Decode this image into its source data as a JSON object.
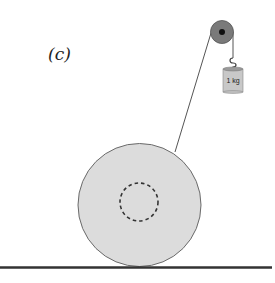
{
  "figure": {
    "panel_label": "(c)",
    "mass_label": "1 kg"
  },
  "colors": {
    "disk_fill": "#dcdcdc",
    "disk_stroke": "#6a6a6a",
    "pulley_fill": "#7a7a7a",
    "pulley_hub": "#111111",
    "ground": "#333333",
    "weight_fill": "#c8c8c8",
    "string": "#555555"
  }
}
